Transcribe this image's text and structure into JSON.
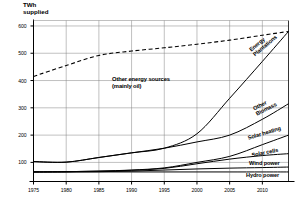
{
  "chart_data": {
    "type": "line",
    "title": "",
    "ylabel": "TWh\nsupplied",
    "xlabel": "",
    "xlim": [
      1975,
      2014
    ],
    "ylim": [
      30,
      620
    ],
    "grid": true,
    "legend_position": "inline-right-of-curves",
    "yticks": [
      100,
      200,
      300,
      400,
      500,
      600
    ],
    "xticks": [
      1975,
      1980,
      1985,
      1990,
      1995,
      2000,
      2005,
      2010
    ],
    "x": [
      1975,
      1980,
      1985,
      1990,
      1995,
      2000,
      2005,
      2010,
      2014
    ],
    "annotations": [
      {
        "text": "Other energy sources\n(mainly oil)",
        "x": 1990,
        "y": 340
      }
    ],
    "series": [
      {
        "name": "Total supply",
        "label": "",
        "style": "dashed",
        "values": [
          415,
          455,
          492,
          508,
          520,
          533,
          548,
          566,
          580
        ]
      },
      {
        "name": "Energy Plantations",
        "label": "Energy\nPlantations",
        "style": "solid",
        "values": [
          103,
          101,
          118,
          135,
          152,
          205,
          335,
          470,
          580
        ]
      },
      {
        "name": "Other Biomass",
        "label": "Other\nBiomass",
        "style": "solid",
        "values": [
          103,
          101,
          118,
          135,
          152,
          175,
          200,
          258,
          315
        ]
      },
      {
        "name": "Solar heating",
        "label": "Solar heating",
        "style": "solid",
        "values": [
          65,
          66,
          68,
          72,
          80,
          100,
          122,
          165,
          200
        ]
      },
      {
        "name": "Solar cells",
        "label": "Solar cells",
        "style": "solid",
        "values": [
          65,
          66,
          68,
          71,
          78,
          95,
          112,
          125,
          132
        ]
      },
      {
        "name": "Wind power",
        "label": "Wind power",
        "style": "solid",
        "values": [
          65,
          65,
          66,
          68,
          72,
          76,
          79,
          81,
          83
        ]
      },
      {
        "name": "Hydro power",
        "label": "Hydro power",
        "style": "solid",
        "values": [
          65,
          65,
          65,
          65,
          65,
          65,
          65,
          65,
          65
        ]
      }
    ],
    "colors": {
      "line": "#000000",
      "grid": "#808080",
      "axis": "#000000",
      "background": "#ffffff"
    }
  },
  "labels": {
    "y_axis_title": "TWh\nsupplied",
    "yticks": [
      "600",
      "500",
      "400",
      "300",
      "200",
      "100"
    ],
    "xticks": [
      "1975",
      "1980",
      "1985",
      "1990",
      "1995",
      "2000",
      "2005",
      "2010"
    ],
    "annotation_other": "Other energy sources\n(mainly oil)",
    "energy_plantations": "Energy\nPlantations",
    "other_biomass": "Other\nBiomass",
    "solar_heating": "Solar heating",
    "solar_cells": "Solar cells",
    "wind_power": "Wind power",
    "hydro_power": "Hydro power"
  }
}
